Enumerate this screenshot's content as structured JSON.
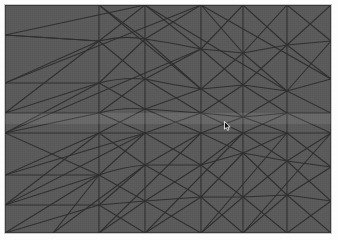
{
  "viewport": {
    "title": "Triangular Mesh Viewport",
    "width": 338,
    "height": 240,
    "frame": {
      "x": 4,
      "y": 4,
      "width": 328,
      "height": 230
    },
    "background_color": "#5a5a5a",
    "frame_border_color": "#c9c9c9",
    "page_background_color": "#fdfdfd"
  },
  "mesh": {
    "label": "unstructured triangular mesh",
    "edge_color": "#2e2e2e",
    "edge_width": 1.1,
    "fill_color": "#5a5a5a",
    "domain_width": 326,
    "domain_height": 228,
    "node_count": 52,
    "element_count": 88
  },
  "highlight": {
    "label": "horizontal highlight band",
    "color": "#ffffff",
    "opacity": 0.085,
    "y": 108,
    "height": 11
  },
  "cursor": {
    "label": "mouse-pointer",
    "x": 219,
    "y": 116,
    "color": "#111111",
    "outline_color": "#ffffff"
  },
  "chart_data": {
    "type": "mesh",
    "xlabel": "",
    "ylabel": "",
    "xlim": [
      0,
      326
    ],
    "ylim": [
      0,
      228
    ],
    "grid": false,
    "legend": "none",
    "nodes": [
      [
        0,
        0
      ],
      [
        48,
        0
      ],
      [
        94,
        0
      ],
      [
        140,
        0
      ],
      [
        196,
        0
      ],
      [
        238,
        0
      ],
      [
        282,
        0
      ],
      [
        326,
        0
      ],
      [
        0,
        30
      ],
      [
        0,
        78
      ],
      [
        0,
        108
      ],
      [
        0,
        128
      ],
      [
        0,
        170
      ],
      [
        0,
        200
      ],
      [
        0,
        228
      ],
      [
        326,
        36
      ],
      [
        326,
        74
      ],
      [
        326,
        108
      ],
      [
        326,
        128
      ],
      [
        326,
        162
      ],
      [
        326,
        196
      ],
      [
        326,
        228
      ],
      [
        48,
        228
      ],
      [
        94,
        228
      ],
      [
        140,
        228
      ],
      [
        196,
        228
      ],
      [
        238,
        228
      ],
      [
        282,
        228
      ],
      [
        94,
        36
      ],
      [
        140,
        34
      ],
      [
        196,
        44
      ],
      [
        238,
        48
      ],
      [
        282,
        40
      ],
      [
        94,
        78
      ],
      [
        140,
        74
      ],
      [
        196,
        84
      ],
      [
        238,
        80
      ],
      [
        282,
        86
      ],
      [
        94,
        108
      ],
      [
        140,
        104
      ],
      [
        196,
        108
      ],
      [
        238,
        112
      ],
      [
        282,
        108
      ],
      [
        94,
        128
      ],
      [
        140,
        128
      ],
      [
        196,
        128
      ],
      [
        238,
        128
      ],
      [
        282,
        128
      ],
      [
        94,
        170
      ],
      [
        140,
        160
      ],
      [
        196,
        160
      ],
      [
        238,
        148
      ],
      [
        282,
        156
      ],
      [
        94,
        200
      ],
      [
        140,
        196
      ],
      [
        196,
        192
      ],
      [
        238,
        192
      ],
      [
        282,
        190
      ]
    ]
  },
  "accessibility": {
    "alt": "A dark gray rectangular panel filled with an unstructured triangular finite element mesh of thin dark lines, with a faint light horizontal band across the middle and a small mouse cursor right of center."
  }
}
